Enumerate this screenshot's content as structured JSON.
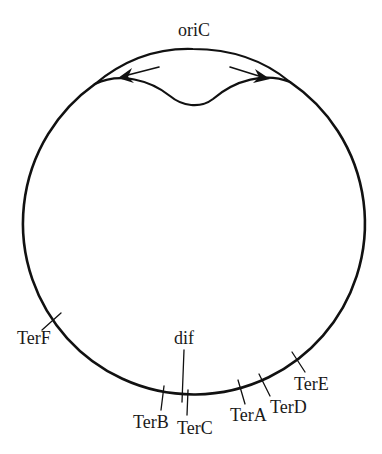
{
  "figure": {
    "type": "circular chromosome replication diagram",
    "stroke_color": "#111111",
    "background": "#ffffff"
  },
  "labels": {
    "origin": "oriC",
    "dif": "dif",
    "terminators": [
      {
        "id": "TerF",
        "label": "TerF"
      },
      {
        "id": "TerB",
        "label": "TerB"
      },
      {
        "id": "TerC",
        "label": "TerC"
      },
      {
        "id": "TerA",
        "label": "TerA"
      },
      {
        "id": "TerD",
        "label": "TerD"
      },
      {
        "id": "TerE",
        "label": "TerE"
      }
    ]
  },
  "replication_forks": {
    "count": 2,
    "directions": [
      "left",
      "right"
    ]
  }
}
